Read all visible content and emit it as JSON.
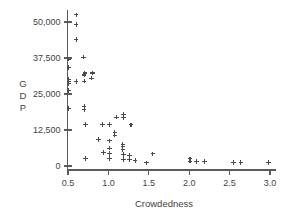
{
  "chart_data": {
    "type": "scatter",
    "title": "",
    "xlabel": "Crowdedness",
    "ylabel": "GDP",
    "ylabel_letters": [
      "G",
      "D",
      "P"
    ],
    "marker": "plus-cross",
    "marker_color": "#4a4a4a",
    "grid": false,
    "legend": null,
    "xlim": [
      0.42,
      3.08
    ],
    "ylim": [
      -2200,
      54000
    ],
    "xticks": [
      0.5,
      1.0,
      1.5,
      2.0,
      2.5,
      3.0
    ],
    "xtick_labels": [
      "0.5",
      "1.0",
      "1.5",
      "2.0",
      "2.5",
      "3.0"
    ],
    "yticks": [
      0,
      12500,
      25000,
      37500,
      50000
    ],
    "ytick_labels": [
      "0",
      "12,500",
      "25,000",
      "37,500",
      "50,000"
    ],
    "points": [
      {
        "x": 0.6,
        "y": 52500
      },
      {
        "x": 0.6,
        "y": 49200
      },
      {
        "x": 0.6,
        "y": 44000
      },
      {
        "x": 0.69,
        "y": 37800
      },
      {
        "x": 0.51,
        "y": 37100
      },
      {
        "x": 0.51,
        "y": 34100
      },
      {
        "x": 0.71,
        "y": 32300
      },
      {
        "x": 0.8,
        "y": 32300
      },
      {
        "x": 0.7,
        "y": 31600
      },
      {
        "x": 0.79,
        "y": 30500
      },
      {
        "x": 0.51,
        "y": 30100
      },
      {
        "x": 0.51,
        "y": 29400
      },
      {
        "x": 0.7,
        "y": 29500
      },
      {
        "x": 0.51,
        "y": 28700
      },
      {
        "x": 0.6,
        "y": 29300
      },
      {
        "x": 0.51,
        "y": 26300
      },
      {
        "x": 0.51,
        "y": 20000
      },
      {
        "x": 0.7,
        "y": 20700
      },
      {
        "x": 0.7,
        "y": 19600
      },
      {
        "x": 1.1,
        "y": 17000
      },
      {
        "x": 1.19,
        "y": 18000
      },
      {
        "x": 1.19,
        "y": 16900
      },
      {
        "x": 0.72,
        "y": 14400
      },
      {
        "x": 0.93,
        "y": 14400
      },
      {
        "x": 1.01,
        "y": 14400
      },
      {
        "x": 1.28,
        "y": 14300
      },
      {
        "x": 1.08,
        "y": 11700
      },
      {
        "x": 1.08,
        "y": 10700
      },
      {
        "x": 0.88,
        "y": 9100
      },
      {
        "x": 1.01,
        "y": 8700
      },
      {
        "x": 1.18,
        "y": 7600
      },
      {
        "x": 1.18,
        "y": 6700
      },
      {
        "x": 1.01,
        "y": 6200
      },
      {
        "x": 1.18,
        "y": 5700
      },
      {
        "x": 0.94,
        "y": 4600
      },
      {
        "x": 1.01,
        "y": 4300
      },
      {
        "x": 1.19,
        "y": 3900
      },
      {
        "x": 1.26,
        "y": 3600
      },
      {
        "x": 1.55,
        "y": 4200
      },
      {
        "x": 0.72,
        "y": 2700
      },
      {
        "x": 1.01,
        "y": 2600
      },
      {
        "x": 1.19,
        "y": 2200
      },
      {
        "x": 1.26,
        "y": 2100
      },
      {
        "x": 1.33,
        "y": 2000
      },
      {
        "x": 1.47,
        "y": 1100
      },
      {
        "x": 2.01,
        "y": 2500
      },
      {
        "x": 2.01,
        "y": 1700
      },
      {
        "x": 2.09,
        "y": 1500
      },
      {
        "x": 2.19,
        "y": 1500
      },
      {
        "x": 2.55,
        "y": 1300
      },
      {
        "x": 2.64,
        "y": 1300
      },
      {
        "x": 2.98,
        "y": 1200
      }
    ]
  },
  "geometry": {
    "x_pixel_at_xmin_tick": 68,
    "x_pixel_at_xmax_tick": 270,
    "y_pixel_at_zero": 166,
    "y_pixel_at_50000": 22
  }
}
